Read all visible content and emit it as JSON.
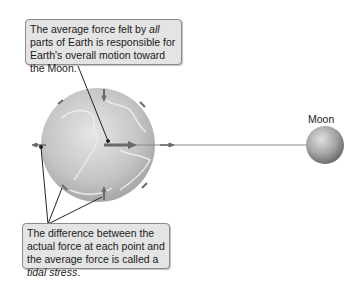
{
  "top_callout": {
    "text_before": "The average force felt by ",
    "text_italic": "all",
    "text_after": " parts of Earth is responsible for Earth's overall motion toward the Moon."
  },
  "bottom_callout": {
    "text_before": "The difference between the actual force at each point and the average force is called a ",
    "text_italic": "tidal stress",
    "text_after": "."
  },
  "labels": {
    "moon": "Moon"
  },
  "colors": {
    "callout_bg": "#e4e4e4",
    "callout_border": "#8a8a8a",
    "earth_fill": "#c8c8c8",
    "arrow": "#6a6a6a",
    "moon_fill": "#a8a8a8"
  }
}
